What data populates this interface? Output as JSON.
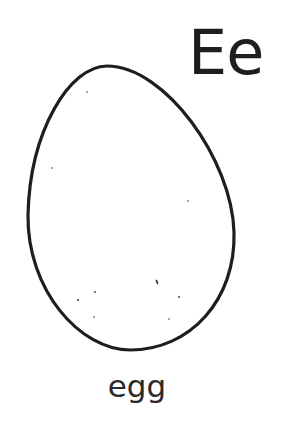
{
  "page": {
    "letters": "Ee",
    "word": "egg",
    "illustration": "egg-outline",
    "colors": {
      "ink": "#1e1e1e",
      "background": "#ffffff"
    }
  }
}
